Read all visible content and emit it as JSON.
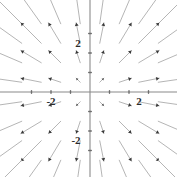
{
  "figure": {
    "title": "",
    "background_color": "#ffffff",
    "width": 177,
    "height": 177
  },
  "axes": {
    "x_axis_name": "x-axis",
    "y_axis_name": "y-axis",
    "axis_color": "#8a8a8a",
    "origin_px": {
      "x": 90,
      "y": 92
    },
    "scale_px_per_unit": 19.5,
    "x_labels": [
      {
        "text": "-2",
        "value": -2,
        "px_x": 51,
        "px_y": 105
      },
      {
        "text": "2",
        "value": 2,
        "px_x": 139,
        "px_y": 105
      }
    ],
    "y_labels": [
      {
        "text": "2",
        "value": 2,
        "px_x": 78,
        "px_y": 47
      },
      {
        "text": "-2",
        "value": -2,
        "px_x": 76,
        "px_y": 144
      }
    ],
    "x_ticks": [
      -3,
      -2,
      -1,
      1,
      2,
      3
    ],
    "y_ticks": [
      -3,
      -2,
      -1,
      1,
      2,
      3
    ]
  },
  "chart_data": {
    "type": "scatter",
    "subtype": "vector-field",
    "title": "",
    "xlabel": "",
    "ylabel": "",
    "xlim": [
      -4.62,
      4.46
    ],
    "ylim": [
      -4.36,
      4.72
    ],
    "grid": false,
    "legend": null,
    "field_formula": "F(x, y) = <x, y>",
    "arrow_color": "#a8a8a8",
    "arrowhead_color": "#3a3a3a",
    "grid_x": [
      -3.5,
      -2.5,
      -1.5,
      -0.5,
      0.5,
      1.5,
      2.5,
      3.5
    ],
    "grid_y": [
      3.5,
      2.5,
      1.5,
      0.5,
      -0.5,
      -1.5,
      -2.5,
      -3.5
    ],
    "arrow_scale": 0.42,
    "vectors": [
      {
        "x": -3.5,
        "y": 3.5,
        "u": -3.5,
        "v": 3.5
      },
      {
        "x": -2.5,
        "y": 3.5,
        "u": -2.5,
        "v": 3.5
      },
      {
        "x": -1.5,
        "y": 3.5,
        "u": -1.5,
        "v": 3.5
      },
      {
        "x": -0.5,
        "y": 3.5,
        "u": -0.5,
        "v": 3.5
      },
      {
        "x": 0.5,
        "y": 3.5,
        "u": 0.5,
        "v": 3.5
      },
      {
        "x": 1.5,
        "y": 3.5,
        "u": 1.5,
        "v": 3.5
      },
      {
        "x": 2.5,
        "y": 3.5,
        "u": 2.5,
        "v": 3.5
      },
      {
        "x": 3.5,
        "y": 3.5,
        "u": 3.5,
        "v": 3.5
      },
      {
        "x": -3.5,
        "y": 2.5,
        "u": -3.5,
        "v": 2.5
      },
      {
        "x": -2.5,
        "y": 2.5,
        "u": -2.5,
        "v": 2.5
      },
      {
        "x": -1.5,
        "y": 2.5,
        "u": -1.5,
        "v": 2.5
      },
      {
        "x": -0.5,
        "y": 2.5,
        "u": -0.5,
        "v": 2.5
      },
      {
        "x": 0.5,
        "y": 2.5,
        "u": 0.5,
        "v": 2.5
      },
      {
        "x": 1.5,
        "y": 2.5,
        "u": 1.5,
        "v": 2.5
      },
      {
        "x": 2.5,
        "y": 2.5,
        "u": 2.5,
        "v": 2.5
      },
      {
        "x": 3.5,
        "y": 2.5,
        "u": 3.5,
        "v": 2.5
      },
      {
        "x": -3.5,
        "y": 1.5,
        "u": -3.5,
        "v": 1.5
      },
      {
        "x": -2.5,
        "y": 1.5,
        "u": -2.5,
        "v": 1.5
      },
      {
        "x": -1.5,
        "y": 1.5,
        "u": -1.5,
        "v": 1.5
      },
      {
        "x": -0.5,
        "y": 1.5,
        "u": -0.5,
        "v": 1.5
      },
      {
        "x": 0.5,
        "y": 1.5,
        "u": 0.5,
        "v": 1.5
      },
      {
        "x": 1.5,
        "y": 1.5,
        "u": 1.5,
        "v": 1.5
      },
      {
        "x": 2.5,
        "y": 1.5,
        "u": 2.5,
        "v": 1.5
      },
      {
        "x": 3.5,
        "y": 1.5,
        "u": 3.5,
        "v": 1.5
      },
      {
        "x": -3.5,
        "y": 0.5,
        "u": -3.5,
        "v": 0.5
      },
      {
        "x": -2.5,
        "y": 0.5,
        "u": -2.5,
        "v": 0.5
      },
      {
        "x": -1.5,
        "y": 0.5,
        "u": -1.5,
        "v": 0.5
      },
      {
        "x": -0.5,
        "y": 0.5,
        "u": -0.5,
        "v": 0.5
      },
      {
        "x": 0.5,
        "y": 0.5,
        "u": 0.5,
        "v": 0.5
      },
      {
        "x": 1.5,
        "y": 0.5,
        "u": 1.5,
        "v": 0.5
      },
      {
        "x": 2.5,
        "y": 0.5,
        "u": 2.5,
        "v": 0.5
      },
      {
        "x": 3.5,
        "y": 0.5,
        "u": 3.5,
        "v": 0.5
      },
      {
        "x": -3.5,
        "y": -0.5,
        "u": -3.5,
        "v": -0.5
      },
      {
        "x": -2.5,
        "y": -0.5,
        "u": -2.5,
        "v": -0.5
      },
      {
        "x": -1.5,
        "y": -0.5,
        "u": -1.5,
        "v": -0.5
      },
      {
        "x": -0.5,
        "y": -0.5,
        "u": -0.5,
        "v": -0.5
      },
      {
        "x": 0.5,
        "y": -0.5,
        "u": 0.5,
        "v": -0.5
      },
      {
        "x": 1.5,
        "y": -0.5,
        "u": 1.5,
        "v": -0.5
      },
      {
        "x": 2.5,
        "y": -0.5,
        "u": 2.5,
        "v": -0.5
      },
      {
        "x": 3.5,
        "y": -0.5,
        "u": 3.5,
        "v": -0.5
      },
      {
        "x": -3.5,
        "y": -1.5,
        "u": -3.5,
        "v": -1.5
      },
      {
        "x": -2.5,
        "y": -1.5,
        "u": -2.5,
        "v": -1.5
      },
      {
        "x": -1.5,
        "y": -1.5,
        "u": -1.5,
        "v": -1.5
      },
      {
        "x": -0.5,
        "y": -1.5,
        "u": -0.5,
        "v": -1.5
      },
      {
        "x": 0.5,
        "y": -1.5,
        "u": 0.5,
        "v": -1.5
      },
      {
        "x": 1.5,
        "y": -1.5,
        "u": 1.5,
        "v": -1.5
      },
      {
        "x": 2.5,
        "y": -1.5,
        "u": 2.5,
        "v": -1.5
      },
      {
        "x": 3.5,
        "y": -1.5,
        "u": 3.5,
        "v": -1.5
      },
      {
        "x": -3.5,
        "y": -2.5,
        "u": -3.5,
        "v": -2.5
      },
      {
        "x": -2.5,
        "y": -2.5,
        "u": -2.5,
        "v": -2.5
      },
      {
        "x": -1.5,
        "y": -2.5,
        "u": -1.5,
        "v": -2.5
      },
      {
        "x": -0.5,
        "y": -2.5,
        "u": -0.5,
        "v": -2.5
      },
      {
        "x": 0.5,
        "y": -2.5,
        "u": 0.5,
        "v": -2.5
      },
      {
        "x": 1.5,
        "y": -2.5,
        "u": 1.5,
        "v": -2.5
      },
      {
        "x": 2.5,
        "y": -2.5,
        "u": 2.5,
        "v": -2.5
      },
      {
        "x": 3.5,
        "y": -2.5,
        "u": 3.5,
        "v": -2.5
      },
      {
        "x": -3.5,
        "y": -3.5,
        "u": -3.5,
        "v": -3.5
      },
      {
        "x": -2.5,
        "y": -3.5,
        "u": -2.5,
        "v": -3.5
      },
      {
        "x": -1.5,
        "y": -3.5,
        "u": -1.5,
        "v": -3.5
      },
      {
        "x": -0.5,
        "y": -3.5,
        "u": -0.5,
        "v": -3.5
      },
      {
        "x": 0.5,
        "y": -3.5,
        "u": 0.5,
        "v": -3.5
      },
      {
        "x": 1.5,
        "y": -3.5,
        "u": 1.5,
        "v": -3.5
      },
      {
        "x": 2.5,
        "y": -3.5,
        "u": 2.5,
        "v": -3.5
      },
      {
        "x": 3.5,
        "y": -3.5,
        "u": 3.5,
        "v": -3.5
      }
    ]
  }
}
